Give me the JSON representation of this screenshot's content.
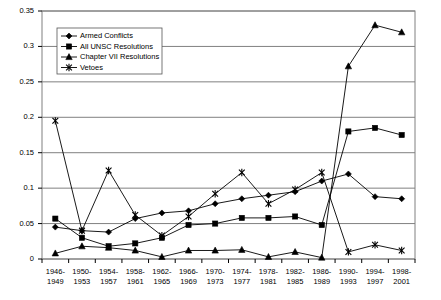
{
  "chart_data": {
    "type": "line",
    "title": "",
    "xlabel": "",
    "ylabel": "",
    "ylim": [
      0,
      0.35
    ],
    "ytick_step": 0.05,
    "grid": true,
    "legend_position": "top-left-inside",
    "yticks": [
      "0",
      "0.05",
      "0.1",
      "0.15",
      "0.2",
      "0.25",
      "0.3",
      "0.35"
    ],
    "ytick_values": [
      0,
      0.05,
      0.1,
      0.15,
      0.2,
      0.25,
      0.3,
      0.35
    ],
    "categories": [
      "1946-\n1949",
      "1950-\n1953",
      "1954-\n1957",
      "1958-\n1961",
      "1962-\n1965",
      "1966-\n1969",
      "1970-\n1973",
      "1974-\n1977",
      "1978-\n1981",
      "1982-\n1985",
      "1986-\n1989",
      "1990-\n1993",
      "1994-\n1997",
      "1998-\n2001"
    ],
    "categories_line1": [
      "1946-",
      "1950-",
      "1954-",
      "1958-",
      "1962-",
      "1966-",
      "1970-",
      "1974-",
      "1978-",
      "1982-",
      "1986-",
      "1990-",
      "1994-",
      "1998-"
    ],
    "categories_line2": [
      "1949",
      "1953",
      "1957",
      "1961",
      "1965",
      "1969",
      "1973",
      "1977",
      "1981",
      "1985",
      "1989",
      "1993",
      "1997",
      "2001"
    ],
    "series": [
      {
        "name": "Armed Conflicts",
        "marker": "diamond",
        "color": "#000000",
        "values": [
          0.045,
          0.04,
          0.038,
          0.057,
          0.065,
          0.068,
          0.078,
          0.085,
          0.09,
          0.095,
          0.11,
          0.12,
          0.088,
          0.085
        ]
      },
      {
        "name": "All UNSC Resolutions",
        "marker": "square",
        "color": "#000000",
        "values": [
          0.057,
          0.03,
          0.018,
          0.022,
          0.03,
          0.048,
          0.05,
          0.058,
          0.058,
          0.06,
          0.048,
          0.18,
          0.185,
          0.175
        ]
      },
      {
        "name": "Chapter VII Resolutions",
        "marker": "triangle",
        "color": "#000000",
        "values": [
          0.008,
          0.018,
          0.016,
          0.012,
          0.003,
          0.012,
          0.012,
          0.013,
          0.003,
          0.01,
          0.002,
          0.272,
          0.33,
          0.32
        ]
      },
      {
        "name": "Vetoes",
        "marker": "cross",
        "color": "#000000",
        "values": [
          0.195,
          0.04,
          0.125,
          0.062,
          0.033,
          0.06,
          0.092,
          0.122,
          0.078,
          0.098,
          0.122,
          0.01,
          0.02,
          0.012
        ]
      }
    ]
  },
  "legend": {
    "items": [
      {
        "label": "Armed Conflicts",
        "marker": "diamond"
      },
      {
        "label": "All UNSC Resolutions",
        "marker": "square"
      },
      {
        "label": "Chapter VII Resolutions",
        "marker": "triangle"
      },
      {
        "label": "Vetoes",
        "marker": "cross"
      }
    ]
  }
}
